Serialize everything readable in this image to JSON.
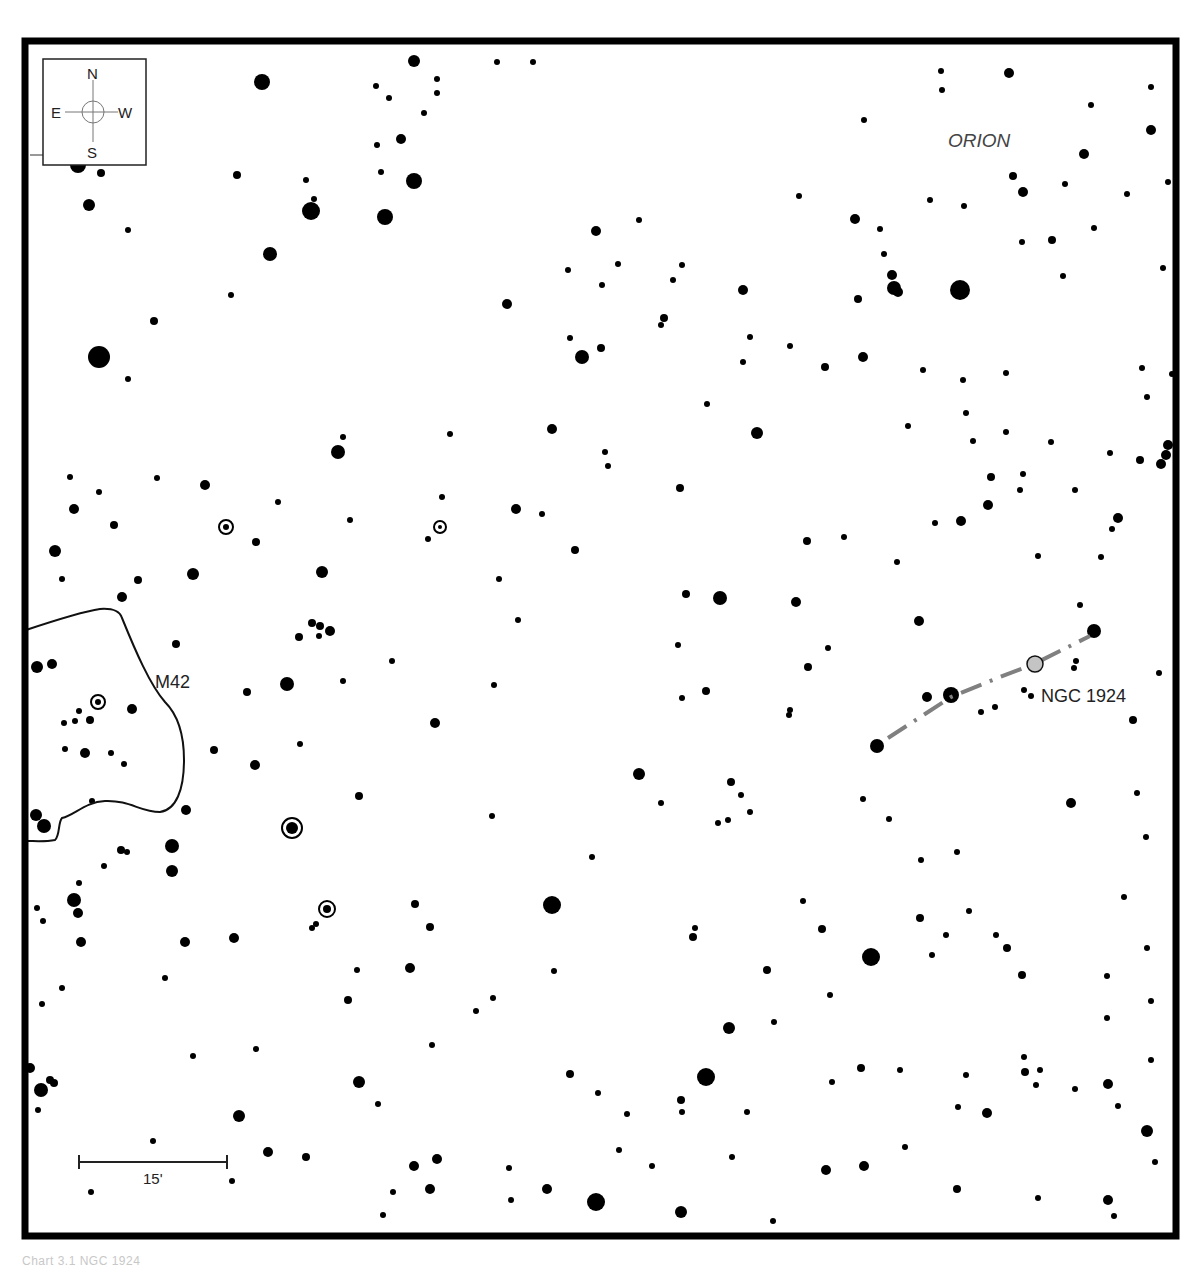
{
  "chart": {
    "title": "",
    "constellation_label": "ORION",
    "compass": {
      "north": "N",
      "south": "S",
      "east": "E",
      "west": "W"
    },
    "scale_bar": {
      "label": "15'"
    },
    "objects": [
      {
        "name": "M42",
        "label": "M42",
        "type": "nebula"
      },
      {
        "name": "NGC 1924",
        "label": "NGC 1924",
        "type": "galaxy"
      }
    ],
    "colors": {
      "frame": "#000000",
      "star": "#000000",
      "target": "#c4c4c4",
      "pointer_line": "#808080",
      "background": "#ffffff"
    }
  },
  "caption": {
    "text": "Chart 3.1 NGC 1924"
  },
  "stars": [
    [
      262,
      82,
      8
    ],
    [
      414,
      61,
      6
    ],
    [
      437,
      79,
      3
    ],
    [
      497,
      62,
      3
    ],
    [
      533,
      62,
      3
    ],
    [
      376,
      86,
      3
    ],
    [
      389,
      98,
      3
    ],
    [
      437,
      93,
      3
    ],
    [
      424,
      113,
      3
    ],
    [
      401,
      139,
      5
    ],
    [
      377,
      145,
      3
    ],
    [
      414,
      181,
      8
    ],
    [
      385,
      217,
      8
    ],
    [
      381,
      172,
      3
    ],
    [
      311,
      211,
      9
    ],
    [
      314,
      199,
      3
    ],
    [
      306,
      180,
      3
    ],
    [
      237,
      175,
      4
    ],
    [
      270,
      254,
      7
    ],
    [
      231,
      295,
      3
    ],
    [
      154,
      321,
      4
    ],
    [
      99,
      357,
      11
    ],
    [
      128,
      379,
      3
    ],
    [
      89,
      205,
      6
    ],
    [
      128,
      230,
      3
    ],
    [
      78,
      165,
      8
    ],
    [
      101,
      173,
      4
    ],
    [
      596,
      231,
      5
    ],
    [
      639,
      220,
      3
    ],
    [
      568,
      270,
      3
    ],
    [
      618,
      264,
      3
    ],
    [
      682,
      265,
      3
    ],
    [
      602,
      285,
      3
    ],
    [
      673,
      280,
      3
    ],
    [
      507,
      304,
      5
    ],
    [
      743,
      290,
      5
    ],
    [
      664,
      318,
      4
    ],
    [
      661,
      325,
      3
    ],
    [
      570,
      338,
      3
    ],
    [
      601,
      348,
      4
    ],
    [
      582,
      357,
      7
    ],
    [
      750,
      337,
      3
    ],
    [
      743,
      362,
      3
    ],
    [
      790,
      346,
      3
    ],
    [
      825,
      367,
      4
    ],
    [
      863,
      357,
      5
    ],
    [
      799,
      196,
      3
    ],
    [
      855,
      219,
      5
    ],
    [
      880,
      229,
      3
    ],
    [
      884,
      254,
      3
    ],
    [
      892,
      275,
      5
    ],
    [
      894,
      288,
      7
    ],
    [
      898,
      292,
      5
    ],
    [
      858,
      299,
      4
    ],
    [
      960,
      290,
      10
    ],
    [
      941,
      71,
      3
    ],
    [
      1009,
      73,
      5
    ],
    [
      942,
      90,
      3
    ],
    [
      1091,
      105,
      3
    ],
    [
      1151,
      87,
      3
    ],
    [
      864,
      120,
      3
    ],
    [
      1151,
      130,
      5
    ],
    [
      1084,
      154,
      5
    ],
    [
      1013,
      176,
      4
    ],
    [
      1023,
      192,
      5
    ],
    [
      1065,
      184,
      3
    ],
    [
      1127,
      194,
      3
    ],
    [
      930,
      200,
      3
    ],
    [
      964,
      206,
      3
    ],
    [
      1168,
      182,
      3
    ],
    [
      1022,
      242,
      3
    ],
    [
      1052,
      240,
      4
    ],
    [
      1094,
      228,
      3
    ],
    [
      1063,
      276,
      3
    ],
    [
      1163,
      268,
      3
    ],
    [
      707,
      404,
      3
    ],
    [
      757,
      433,
      6
    ],
    [
      552,
      429,
      5
    ],
    [
      923,
      370,
      3
    ],
    [
      963,
      380,
      3
    ],
    [
      1006,
      373,
      3
    ],
    [
      1142,
      368,
      3
    ],
    [
      1172,
      374,
      3
    ],
    [
      1147,
      397,
      3
    ],
    [
      966,
      413,
      3
    ],
    [
      908,
      426,
      3
    ],
    [
      973,
      441,
      3
    ],
    [
      1006,
      432,
      3
    ],
    [
      1051,
      442,
      3
    ],
    [
      1168,
      445,
      5
    ],
    [
      1166,
      455,
      5
    ],
    [
      1161,
      464,
      5
    ],
    [
      1140,
      460,
      4
    ],
    [
      1110,
      453,
      3
    ],
    [
      991,
      477,
      4
    ],
    [
      1023,
      474,
      3
    ],
    [
      1075,
      490,
      3
    ],
    [
      1020,
      490,
      3
    ],
    [
      988,
      505,
      5
    ],
    [
      961,
      521,
      5
    ],
    [
      935,
      523,
      3
    ],
    [
      1118,
      518,
      5
    ],
    [
      1112,
      529,
      3
    ],
    [
      605,
      452,
      3
    ],
    [
      608,
      466,
      3
    ],
    [
      680,
      488,
      4
    ],
    [
      516,
      509,
      5
    ],
    [
      542,
      514,
      3
    ],
    [
      442,
      497,
      3
    ],
    [
      440,
      524,
      3
    ],
    [
      428,
      539,
      3
    ],
    [
      575,
      550,
      4
    ],
    [
      807,
      541,
      4
    ],
    [
      844,
      537,
      3
    ],
    [
      897,
      562,
      3
    ],
    [
      1038,
      556,
      3
    ],
    [
      1101,
      557,
      3
    ],
    [
      499,
      579,
      3
    ],
    [
      686,
      594,
      4
    ],
    [
      720,
      598,
      7
    ],
    [
      796,
      602,
      5
    ],
    [
      518,
      620,
      3
    ],
    [
      919,
      621,
      5
    ],
    [
      1080,
      605,
      3
    ],
    [
      1094,
      631,
      7
    ],
    [
      678,
      645,
      3
    ],
    [
      828,
      648,
      3
    ],
    [
      808,
      667,
      4
    ],
    [
      1159,
      673,
      3
    ],
    [
      1076,
      661,
      3
    ],
    [
      1074,
      668,
      3
    ],
    [
      1024,
      690,
      3
    ],
    [
      1031,
      696,
      3
    ],
    [
      951,
      695,
      8
    ],
    [
      927,
      697,
      5
    ],
    [
      981,
      712,
      3
    ],
    [
      995,
      707,
      3
    ],
    [
      1133,
      720,
      4
    ],
    [
      877,
      746,
      7
    ],
    [
      706,
      691,
      4
    ],
    [
      682,
      698,
      3
    ],
    [
      790,
      710,
      3
    ],
    [
      789,
      715,
      3
    ],
    [
      435,
      723,
      5
    ],
    [
      494,
      685,
      3
    ],
    [
      392,
      661,
      3
    ],
    [
      343,
      681,
      3
    ],
    [
      287,
      684,
      7
    ],
    [
      247,
      692,
      4
    ],
    [
      300,
      744,
      3
    ],
    [
      214,
      750,
      4
    ],
    [
      255,
      765,
      5
    ],
    [
      338,
      452,
      7
    ],
    [
      343,
      437,
      3
    ],
    [
      450,
      434,
      3
    ],
    [
      278,
      502,
      3
    ],
    [
      205,
      485,
      5
    ],
    [
      157,
      478,
      3
    ],
    [
      99,
      492,
      3
    ],
    [
      70,
      477,
      3
    ],
    [
      74,
      509,
      5
    ],
    [
      114,
      525,
      4
    ],
    [
      224,
      527,
      5
    ],
    [
      228,
      527,
      3
    ],
    [
      256,
      542,
      4
    ],
    [
      350,
      520,
      3
    ],
    [
      55,
      551,
      6
    ],
    [
      62,
      579,
      3
    ],
    [
      138,
      580,
      4
    ],
    [
      193,
      574,
      6
    ],
    [
      122,
      597,
      5
    ],
    [
      176,
      644,
      4
    ],
    [
      322,
      572,
      6
    ],
    [
      312,
      623,
      4
    ],
    [
      320,
      626,
      4
    ],
    [
      330,
      631,
      5
    ],
    [
      299,
      637,
      4
    ],
    [
      319,
      636,
      3
    ],
    [
      37,
      667,
      6
    ],
    [
      52,
      664,
      5
    ],
    [
      132,
      709,
      5
    ],
    [
      98,
      701,
      4
    ],
    [
      79,
      711,
      3
    ],
    [
      64,
      723,
      3
    ],
    [
      75,
      721,
      3
    ],
    [
      90,
      720,
      4
    ],
    [
      85,
      753,
      5
    ],
    [
      65,
      749,
      3
    ],
    [
      111,
      753,
      3
    ],
    [
      124,
      764,
      3
    ],
    [
      92,
      801,
      3
    ],
    [
      36,
      815,
      6
    ],
    [
      44,
      826,
      7
    ],
    [
      186,
      810,
      5
    ],
    [
      121,
      850,
      4
    ],
    [
      127,
      852,
      3
    ],
    [
      172,
      846,
      7
    ],
    [
      172,
      871,
      6
    ],
    [
      104,
      866,
      3
    ],
    [
      79,
      883,
      3
    ],
    [
      74,
      900,
      7
    ],
    [
      78,
      913,
      5
    ],
    [
      37,
      908,
      3
    ],
    [
      43,
      921,
      3
    ],
    [
      81,
      942,
      5
    ],
    [
      185,
      942,
      5
    ],
    [
      165,
      978,
      3
    ],
    [
      234,
      938,
      5
    ],
    [
      62,
      988,
      3
    ],
    [
      42,
      1004,
      3
    ],
    [
      359,
      796,
      4
    ],
    [
      492,
      816,
      3
    ],
    [
      639,
      774,
      6
    ],
    [
      661,
      803,
      3
    ],
    [
      731,
      782,
      4
    ],
    [
      741,
      795,
      3
    ],
    [
      718,
      823,
      3
    ],
    [
      728,
      820,
      3
    ],
    [
      750,
      812,
      3
    ],
    [
      863,
      799,
      3
    ],
    [
      889,
      819,
      3
    ],
    [
      1071,
      803,
      5
    ],
    [
      1137,
      793,
      3
    ],
    [
      1146,
      837,
      3
    ],
    [
      957,
      852,
      3
    ],
    [
      921,
      860,
      3
    ],
    [
      592,
      857,
      3
    ],
    [
      552,
      905,
      9
    ],
    [
      415,
      904,
      4
    ],
    [
      430,
      927,
      4
    ],
    [
      357,
      970,
      3
    ],
    [
      410,
      968,
      5
    ],
    [
      316,
      924,
      3
    ],
    [
      312,
      928,
      3
    ],
    [
      348,
      1000,
      4
    ],
    [
      493,
      998,
      3
    ],
    [
      476,
      1011,
      3
    ],
    [
      803,
      901,
      3
    ],
    [
      822,
      929,
      4
    ],
    [
      693,
      937,
      4
    ],
    [
      695,
      928,
      3
    ],
    [
      871,
      957,
      9
    ],
    [
      920,
      918,
      4
    ],
    [
      946,
      935,
      3
    ],
    [
      932,
      955,
      3
    ],
    [
      969,
      911,
      3
    ],
    [
      996,
      935,
      3
    ],
    [
      1007,
      948,
      4
    ],
    [
      1022,
      975,
      4
    ],
    [
      1124,
      897,
      3
    ],
    [
      1147,
      948,
      3
    ],
    [
      1107,
      976,
      3
    ],
    [
      1107,
      1018,
      3
    ],
    [
      1151,
      1001,
      3
    ],
    [
      1151,
      1060,
      3
    ],
    [
      554,
      971,
      3
    ],
    [
      767,
      970,
      4
    ],
    [
      830,
      995,
      3
    ],
    [
      729,
      1028,
      6
    ],
    [
      774,
      1022,
      3
    ],
    [
      432,
      1045,
      3
    ],
    [
      256,
      1049,
      3
    ],
    [
      193,
      1056,
      3
    ],
    [
      30,
      1068,
      5
    ],
    [
      50,
      1080,
      4
    ],
    [
      54,
      1083,
      4
    ],
    [
      41,
      1090,
      7
    ],
    [
      38,
      1110,
      3
    ],
    [
      359,
      1082,
      6
    ],
    [
      378,
      1104,
      3
    ],
    [
      570,
      1074,
      4
    ],
    [
      598,
      1093,
      3
    ],
    [
      706,
      1077,
      9
    ],
    [
      681,
      1100,
      4
    ],
    [
      682,
      1112,
      3
    ],
    [
      627,
      1114,
      3
    ],
    [
      747,
      1112,
      3
    ],
    [
      861,
      1068,
      4
    ],
    [
      832,
      1082,
      3
    ],
    [
      900,
      1070,
      3
    ],
    [
      966,
      1075,
      3
    ],
    [
      1024,
      1057,
      3
    ],
    [
      1025,
      1072,
      4
    ],
    [
      1040,
      1070,
      3
    ],
    [
      1036,
      1085,
      3
    ],
    [
      1075,
      1089,
      3
    ],
    [
      1108,
      1084,
      5
    ],
    [
      1118,
      1106,
      3
    ],
    [
      987,
      1113,
      5
    ],
    [
      958,
      1107,
      3
    ],
    [
      1147,
      1131,
      6
    ],
    [
      1155,
      1162,
      3
    ],
    [
      239,
      1116,
      6
    ],
    [
      153,
      1141,
      3
    ],
    [
      268,
      1152,
      5
    ],
    [
      306,
      1157,
      4
    ],
    [
      414,
      1166,
      5
    ],
    [
      437,
      1159,
      5
    ],
    [
      393,
      1192,
      3
    ],
    [
      430,
      1189,
      5
    ],
    [
      509,
      1168,
      3
    ],
    [
      547,
      1189,
      5
    ],
    [
      596,
      1202,
      9
    ],
    [
      681,
      1212,
      6
    ],
    [
      732,
      1157,
      3
    ],
    [
      619,
      1150,
      3
    ],
    [
      652,
      1166,
      3
    ],
    [
      826,
      1170,
      5
    ],
    [
      864,
      1166,
      5
    ],
    [
      905,
      1147,
      3
    ],
    [
      511,
      1200,
      3
    ],
    [
      383,
      1215,
      3
    ],
    [
      773,
      1221,
      3
    ],
    [
      957,
      1189,
      4
    ],
    [
      1038,
      1198,
      3
    ],
    [
      1108,
      1200,
      5
    ],
    [
      1114,
      1216,
      3
    ],
    [
      91,
      1192,
      3
    ],
    [
      232,
      1181,
      3
    ]
  ],
  "double_stars": [
    [
      292,
      828,
      7
    ],
    [
      327,
      909,
      5
    ],
    [
      98,
      702,
      4
    ],
    [
      226,
      527,
      4
    ],
    [
      440,
      527,
      3
    ]
  ]
}
